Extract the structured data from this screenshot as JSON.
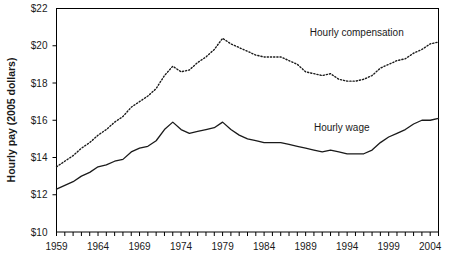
{
  "chart_data": {
    "type": "line",
    "title": "",
    "xlabel": "",
    "ylabel": "Hourly pay (2005 dollars)",
    "xlim": [
      1959,
      2005
    ],
    "ylim": [
      10,
      22
    ],
    "grid": false,
    "legend_position": "inline-on-plot",
    "y_ticks": [
      "$10",
      "$12",
      "$14",
      "$16",
      "$18",
      "$20",
      "$22"
    ],
    "y_tick_values": [
      10,
      12,
      14,
      16,
      18,
      20,
      22
    ],
    "x_tick_labels": [
      "1959",
      "1964",
      "1969",
      "1974",
      "1979",
      "1984",
      "1989",
      "1994",
      "1999",
      "2004"
    ],
    "x_tick_label_values": [
      1959,
      1964,
      1969,
      1974,
      1979,
      1984,
      1989,
      1994,
      1999,
      2004
    ],
    "x_minor_tick_step": 1,
    "x": [
      1959,
      1960,
      1961,
      1962,
      1963,
      1964,
      1965,
      1966,
      1967,
      1968,
      1969,
      1970,
      1971,
      1972,
      1973,
      1974,
      1975,
      1976,
      1977,
      1978,
      1979,
      1980,
      1981,
      1982,
      1983,
      1984,
      1985,
      1986,
      1987,
      1988,
      1989,
      1990,
      1991,
      1992,
      1993,
      1994,
      1995,
      1996,
      1997,
      1998,
      1999,
      2000,
      2001,
      2002,
      2003,
      2004,
      2005
    ],
    "series": [
      {
        "name": "Hourly compensation",
        "style": "dotted",
        "values": [
          13.5,
          13.8,
          14.1,
          14.5,
          14.8,
          15.2,
          15.5,
          15.9,
          16.2,
          16.7,
          17.0,
          17.3,
          17.7,
          18.4,
          18.9,
          18.6,
          18.7,
          19.1,
          19.4,
          19.8,
          20.4,
          20.1,
          19.9,
          19.7,
          19.5,
          19.4,
          19.4,
          19.4,
          19.2,
          19.0,
          18.6,
          18.5,
          18.4,
          18.5,
          18.2,
          18.1,
          18.1,
          18.2,
          18.4,
          18.8,
          19.0,
          19.2,
          19.3,
          19.6,
          19.8,
          20.1,
          20.2
        ]
      },
      {
        "name": "Hourly wage",
        "style": "solid",
        "values": [
          12.3,
          12.5,
          12.7,
          13.0,
          13.2,
          13.5,
          13.6,
          13.8,
          13.9,
          14.3,
          14.5,
          14.6,
          14.9,
          15.5,
          15.9,
          15.5,
          15.3,
          15.4,
          15.5,
          15.6,
          15.9,
          15.5,
          15.2,
          15.0,
          14.9,
          14.8,
          14.8,
          14.8,
          14.7,
          14.6,
          14.5,
          14.4,
          14.3,
          14.4,
          14.3,
          14.2,
          14.2,
          14.2,
          14.4,
          14.8,
          15.1,
          15.3,
          15.5,
          15.8,
          16.0,
          16.0,
          16.1
        ]
      }
    ],
    "annotations": [
      {
        "text": "Hourly compensation",
        "x": 1989.5,
        "y": 20.5
      },
      {
        "text": "Hourly wage",
        "x": 1990.0,
        "y": 15.4
      }
    ]
  },
  "colors": {
    "line": "#1a1a1a",
    "frame": "#000000",
    "background": "#ffffff"
  }
}
